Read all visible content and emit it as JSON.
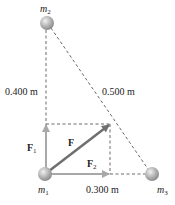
{
  "masses": {
    "m1": {
      "label": "m",
      "sub": "1"
    },
    "m2": {
      "label": "m",
      "sub": "2"
    },
    "m3": {
      "label": "m",
      "sub": "3"
    }
  },
  "distances": {
    "m1_m2": "0.400 m",
    "m2_m3": "0.500 m",
    "m1_m3": "0.300 m"
  },
  "forces": {
    "F": {
      "label": "F"
    },
    "F1": {
      "label": "F",
      "sub": "1"
    },
    "F2": {
      "label": "F",
      "sub": "2"
    }
  },
  "colors": {
    "sphere": "#b5b5b5",
    "dashed": "#6a6a6a",
    "force_total": "#6f6f6f",
    "force_component": "#a8a8a8",
    "text": "#222222"
  }
}
